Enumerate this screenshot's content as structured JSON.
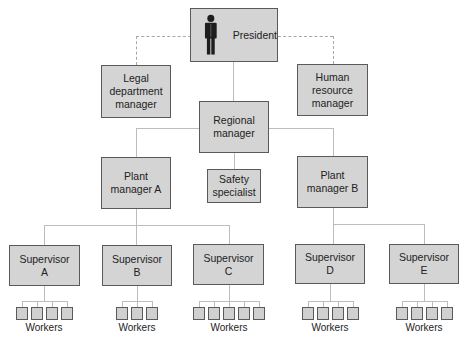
{
  "nodes": {
    "president": "President",
    "legal": "Legal\ndepartment\nmanager",
    "hr": "Human\nresource\nmanager",
    "regional": "Regional\nmanager",
    "safety": "Safety\nspecialist",
    "plant_a": "Plant\nmanager A",
    "plant_b": "Plant\nmanager B",
    "sup_a": "Supervisor\nA",
    "sup_b": "Supervisor\nB",
    "sup_c": "Supervisor\nC",
    "sup_d": "Supervisor\nD",
    "sup_e": "Supervisor\nE"
  },
  "workers_label": "Workers",
  "worker_counts": {
    "sup_a": 4,
    "sup_b": 3,
    "sup_c": 5,
    "sup_d": 4,
    "sup_e": 4
  },
  "icons": {
    "president": "person-icon"
  },
  "colors": {
    "box_fill": "#d4d4d4",
    "box_border": "#5a5a5a",
    "line": "#bdbdbd"
  }
}
